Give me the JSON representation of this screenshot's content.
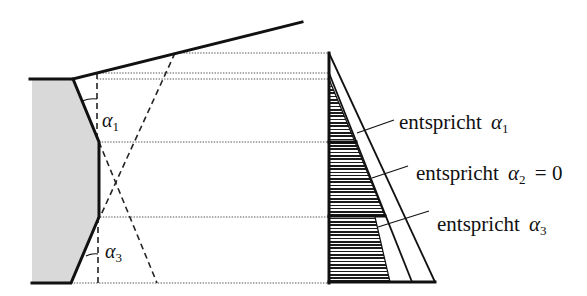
{
  "figure": {
    "colors": {
      "ink": "#111111",
      "wall_fill": "#d9d9d9",
      "background": "#ffffff"
    }
  },
  "wall": {
    "angle_labels": [
      {
        "id": "alpha1",
        "symbol": "α",
        "sub": "1"
      },
      {
        "id": "alpha3",
        "symbol": "α",
        "sub": "3"
      }
    ]
  },
  "pressure_diagram": {
    "annotations": [
      {
        "prefix": "entspricht ",
        "symbol": "α",
        "sub": "1",
        "suffix": ""
      },
      {
        "prefix": "entspricht ",
        "symbol": "α",
        "sub": "2",
        "suffix": " = 0"
      },
      {
        "prefix": "entspricht ",
        "symbol": "α",
        "sub": "3",
        "suffix": ""
      }
    ]
  }
}
